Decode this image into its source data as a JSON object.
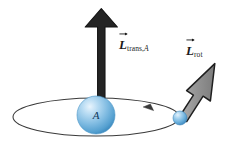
{
  "figure": {
    "name": "angular-momentum-diagram",
    "background_color": "#ffffff",
    "labels": {
      "translational": {
        "symbol": "L",
        "subscript": "trans,",
        "subscript_italic": "A",
        "full_text": "L_trans,A",
        "vector_arrow": true
      },
      "rotational": {
        "symbol": "L",
        "subscript": "rot",
        "full_text": "L_rot",
        "vector_arrow": true
      }
    },
    "body_label": "A",
    "colors": {
      "arrow_dark": "#242424",
      "arrow_gray_fill": "#8d8d8d",
      "orbit_line": "#3a3a3a",
      "sphere_blue_light": "#cfe6f7",
      "sphere_blue_mid": "#7cb8e0",
      "sphere_blue_dark": "#3d8ec4",
      "letter_color": "#123a5c"
    },
    "elements": {
      "large_sphere": {
        "name": "body-A-sphere",
        "cx": 96,
        "cy": 115,
        "r": 19
      },
      "small_sphere": {
        "name": "orbiting-particle-sphere",
        "cx": 180,
        "cy": 118,
        "r": 7
      },
      "orbit_ellipse": {
        "name": "orbit-path",
        "cx": 96,
        "cy": 117,
        "rx": 83,
        "ry": 19
      },
      "orbit_direction_marker": {
        "name": "orbit-direction-arrowhead",
        "x": 150,
        "y": 108,
        "points_left": true
      },
      "translational_arrow": {
        "name": "translational-angular-momentum-arrow",
        "tail_x": 101,
        "tail_y": 113,
        "tip_x": 101,
        "tip_y": 9,
        "shaft_width": 7,
        "head_width": 33,
        "head_length": 19
      },
      "rotational_arrow": {
        "name": "rotational-angular-momentum-arrow",
        "tail_x": 180,
        "tail_y": 117,
        "tip_x": 215,
        "tip_y": 64,
        "shaft_width": 7,
        "head_width": 24,
        "head_length": 20
      }
    }
  }
}
